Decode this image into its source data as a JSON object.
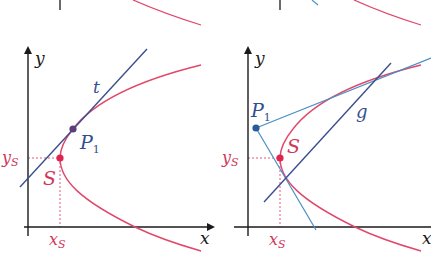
{
  "colors": {
    "axis": "#1a1a1a",
    "curve": "#e0476a",
    "tangent_dark": "#3a4f8f",
    "tangent_light": "#4a8fc2",
    "point_p1_left": "#5a3f7a",
    "point_p1_right": "#2a5a9a",
    "point_s": "#e0234f",
    "dashed": "#e0476a",
    "label_blue": "#2f4f8f",
    "label_red": "#d0375a"
  },
  "left_panel": {
    "axis_x_label": "x",
    "axis_y_label": "y",
    "tangent_label": "t",
    "point_p1_label": "P",
    "point_p1_sub": "1",
    "vertex_label": "S",
    "ys_label": "y",
    "ys_sub": "S",
    "xs_label": "x",
    "xs_sub": "S"
  },
  "right_panel": {
    "axis_x_label": "x",
    "axis_y_label": "y",
    "line_label": "g",
    "point_p1_label": "P",
    "point_p1_sub": "1",
    "vertex_label": "S",
    "ys_label": "y",
    "ys_sub": "S",
    "xs_label": "x",
    "xs_sub": "S"
  }
}
